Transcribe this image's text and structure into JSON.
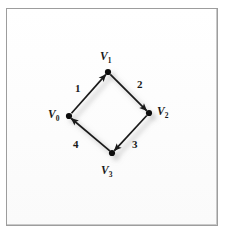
{
  "figure": {
    "type": "directed-graph-diagram",
    "frame": {
      "border_color": "#9d9d9d",
      "background_color": "#fdfdfd"
    },
    "ink_color": "#1a1a1a",
    "shadow_color": "#b4b4b4"
  },
  "graph": {
    "vertices": [
      {
        "id": "v0",
        "label": "V",
        "subscript": "0",
        "x": 69,
        "y": 116
      },
      {
        "id": "v1",
        "label": "V",
        "subscript": "1",
        "x": 108,
        "y": 72
      },
      {
        "id": "v2",
        "label": "V",
        "subscript": "2",
        "x": 149,
        "y": 113
      },
      {
        "id": "v3",
        "label": "V",
        "subscript": "3",
        "x": 112,
        "y": 153
      }
    ],
    "edges": [
      {
        "id": "e1",
        "label": "1",
        "from": "v0",
        "to": "v1",
        "directed": true
      },
      {
        "id": "e2",
        "label": "2",
        "from": "v1",
        "to": "v2",
        "directed": true
      },
      {
        "id": "e3",
        "label": "3",
        "from": "v2",
        "to": "v3",
        "directed": true
      },
      {
        "id": "e4",
        "label": "4",
        "from": "v3",
        "to": "v0",
        "directed": true
      }
    ]
  },
  "labels": {
    "v0": "V",
    "v0_sub": "0",
    "v1": "V",
    "v1_sub": "1",
    "v2": "V",
    "v2_sub": "2",
    "v3": "V",
    "v3_sub": "3",
    "e1": "1",
    "e2": "2",
    "e3": "3",
    "e4": "4"
  }
}
